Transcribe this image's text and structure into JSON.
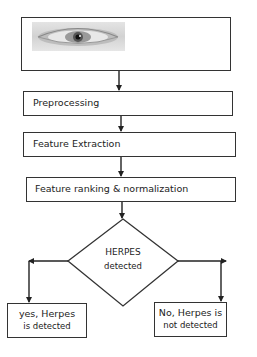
{
  "diagram": {
    "input_image": {
      "icon": "eye-image",
      "description": "grayscale eye photo"
    },
    "steps": [
      {
        "id": "preprocessing",
        "label": "Preprocessing"
      },
      {
        "id": "feature-extraction",
        "label": "Feature Extraction"
      },
      {
        "id": "feature-ranking",
        "label": "Feature ranking & normalization"
      }
    ],
    "decision": {
      "line1": "HERPES",
      "line2": "detected"
    },
    "outcomes": {
      "yes": {
        "line1": "yes, Herpes",
        "line2": "is detected"
      },
      "no": {
        "line1": "No, Herpes is",
        "line2": "not detected"
      }
    },
    "colors": {
      "stroke": "#333333",
      "background": "#ffffff"
    }
  }
}
